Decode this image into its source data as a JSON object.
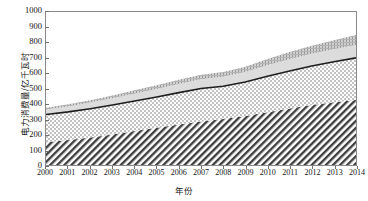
{
  "chart_data": {
    "type": "area",
    "stacked": true,
    "title": "",
    "xlabel": "年份",
    "ylabel": "电力消费量/亿千瓦时",
    "x": [
      2000,
      2001,
      2002,
      2003,
      2004,
      2005,
      2006,
      2007,
      2008,
      2009,
      2010,
      2011,
      2012,
      2013,
      2014
    ],
    "xlim": [
      2000,
      2014
    ],
    "ylim": [
      0,
      1000
    ],
    "ytick_labels": [
      "0",
      "100",
      "200",
      "300",
      "400",
      "500",
      "600",
      "700",
      "800",
      "900",
      "1000"
    ],
    "ytick_values": [
      0,
      100,
      200,
      300,
      400,
      500,
      600,
      700,
      800,
      900,
      1000
    ],
    "xtick_labels": [
      "2000",
      "2001",
      "2002",
      "2003",
      "2004",
      "2005",
      "2006",
      "2007",
      "2008",
      "2009",
      "2010",
      "2011",
      "2012",
      "2013",
      "2014"
    ],
    "grid": false,
    "legend": "none",
    "series": [
      {
        "name": "layer-1-diagonal-hatch",
        "pattern": "diagonal-hatch",
        "color": "#4a4a4a",
        "values": [
          148,
          163,
          180,
          200,
          222,
          243,
          265,
          285,
          300,
          320,
          345,
          370,
          392,
          410,
          425
        ]
      },
      {
        "name": "layer-2-checker",
        "pattern": "checkerboard",
        "color": "#b8b8b8",
        "values": [
          182,
          184,
          188,
          192,
          196,
          202,
          208,
          215,
          215,
          222,
          235,
          245,
          255,
          265,
          275
        ]
      },
      {
        "name": "layer-3-light-gray",
        "pattern": "solid-light-gray",
        "color": "#d2d2d2",
        "values": [
          33,
          36,
          40,
          44,
          48,
          52,
          56,
          60,
          62,
          66,
          72,
          76,
          80,
          82,
          85
        ]
      },
      {
        "name": "layer-4-stipple-gray",
        "pattern": "fine-vertical-stipple",
        "color": "#a9a9a9",
        "values": [
          12,
          14,
          16,
          19,
          22,
          25,
          28,
          30,
          31,
          34,
          40,
          48,
          53,
          58,
          65
        ]
      }
    ],
    "boundary_line": {
      "name": "cumulative-layer-2-line",
      "color": "#1e1e1e",
      "values": [
        330,
        347,
        368,
        392,
        418,
        445,
        473,
        500,
        515,
        542,
        580,
        615,
        647,
        675,
        700
      ]
    },
    "cumulative_totals": [
      375,
      397,
      424,
      455,
      488,
      522,
      557,
      590,
      608,
      642,
      692,
      739,
      780,
      815,
      850
    ]
  }
}
